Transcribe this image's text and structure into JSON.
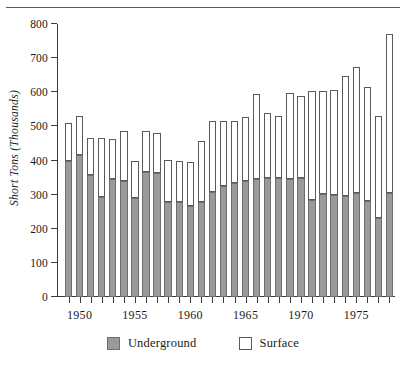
{
  "chart_data": {
    "type": "bar",
    "subtype": "stacked-vertical",
    "title": "",
    "xlabel": "",
    "ylabel": "Short Tons (Thousands)",
    "ylim": [
      0,
      800
    ],
    "ytick_step": 100,
    "yticks": [
      0,
      100,
      200,
      300,
      400,
      500,
      600,
      700,
      800
    ],
    "ytick_labels": [
      "0",
      "100",
      "200",
      "300",
      "400",
      "500",
      "600",
      "700",
      "800"
    ],
    "grid": false,
    "legend_position": "bottom-center",
    "x": [
      1949,
      1950,
      1951,
      1952,
      1953,
      1954,
      1955,
      1956,
      1957,
      1958,
      1959,
      1960,
      1961,
      1962,
      1963,
      1964,
      1965,
      1966,
      1967,
      1968,
      1969,
      1970,
      1971,
      1972,
      1973,
      1974,
      1975,
      1976,
      1977,
      1978
    ],
    "xtick_labels_shown": [
      "1950",
      "1955",
      "1960",
      "1965",
      "1970",
      "1975"
    ],
    "xtick_label_years": [
      1950,
      1955,
      1960,
      1965,
      1970,
      1975
    ],
    "categories": [
      "1949",
      "1950",
      "1951",
      "1952",
      "1953",
      "1954",
      "1955",
      "1956",
      "1957",
      "1958",
      "1959",
      "1960",
      "1961",
      "1962",
      "1963",
      "1964",
      "1965",
      "1966",
      "1967",
      "1968",
      "1969",
      "1970",
      "1971",
      "1972",
      "1973",
      "1974",
      "1975",
      "1976",
      "1977",
      "1978"
    ],
    "series": [
      {
        "name": "Underground",
        "color": "#9a9a9a",
        "values": [
          398,
          415,
          357,
          294,
          345,
          340,
          290,
          366,
          362,
          277,
          277,
          268,
          277,
          307,
          324,
          334,
          341,
          347,
          348,
          348,
          347,
          348,
          283,
          302,
          298,
          296,
          306,
          282,
          231,
          305
        ]
      },
      {
        "name": "Surface",
        "color": "#ffffff",
        "values": [
          112,
          116,
          110,
          171,
          117,
          146,
          110,
          120,
          120,
          124,
          122,
          128,
          180,
          209,
          192,
          182,
          186,
          248,
          192,
          182,
          251,
          241,
          321,
          303,
          308,
          351,
          367,
          333,
          298,
          465
        ]
      }
    ],
    "totals": [
      510,
      531,
      467,
      465,
      462,
      486,
      400,
      486,
      482,
      401,
      399,
      396,
      457,
      516,
      516,
      516,
      527,
      595,
      540,
      530,
      598,
      589,
      604,
      605,
      606,
      647,
      673,
      615,
      529,
      770
    ]
  },
  "legend": {
    "items": [
      {
        "label": "Underground",
        "swatch": "gray-filled-square"
      },
      {
        "label": "Surface",
        "swatch": "white-open-square"
      }
    ]
  },
  "axes": {
    "y_title": "Short Tons (Thousands)"
  }
}
